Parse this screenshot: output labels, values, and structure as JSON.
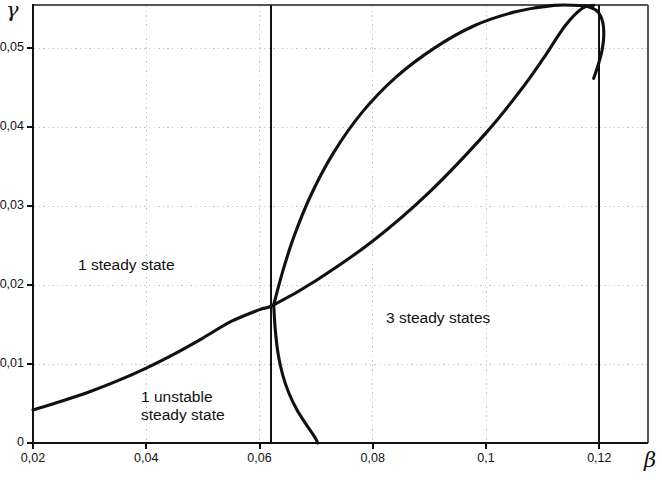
{
  "figure": {
    "type": "chart",
    "background": "#ffffff",
    "ink_color": "#111111",
    "grid_color": "#c8c8c8"
  },
  "axes": {
    "x": {
      "name": "β",
      "ticks": [
        "0,02",
        "0,04",
        "0,06",
        "0,08",
        "0,1",
        "0,12"
      ],
      "tick_values": [
        0.02,
        0.04,
        0.06,
        0.08,
        0.1,
        0.12
      ],
      "range": [
        0.02,
        0.1286
      ]
    },
    "y": {
      "name": "γ",
      "ticks": [
        "0",
        "0,01",
        "0,02",
        "0,03",
        "0,04",
        "0,05"
      ],
      "tick_values": [
        0,
        0.01,
        0.02,
        0.03,
        0.04,
        0.05
      ],
      "range": [
        0,
        0.0555
      ]
    }
  },
  "annotations": {
    "one_steady_state": "1 steady state",
    "three_steady_states": "3 steady states",
    "one_unstable_line1": "1 unstable",
    "one_unstable_line2": "steady state"
  },
  "chart_data": {
    "type": "line",
    "title": "",
    "xlabel": "β",
    "ylabel": "γ",
    "xlim": [
      0.02,
      0.1286
    ],
    "ylim": [
      0.0,
      0.0555
    ],
    "grid": true,
    "grid_style": "dotted",
    "legend": null,
    "xticks": [
      0.02,
      0.04,
      0.06,
      0.08,
      0.1,
      0.12
    ],
    "xticklabels": [
      "0,02",
      "0,04",
      "0,06",
      "0,08",
      "0,1",
      "0,12"
    ],
    "yticks": [
      0,
      0.01,
      0.02,
      0.03,
      0.04,
      0.05
    ],
    "yticklabels": [
      "0",
      "0,01",
      "0,02",
      "0,03",
      "0,04",
      "0,05"
    ],
    "series": [
      {
        "name": "lower fold branch",
        "comment": "rises from left edge through the cusp and on to the apex of the loop",
        "points": [
          [
            0.02,
            0.0042
          ],
          [
            0.025,
            0.0053
          ],
          [
            0.03,
            0.0065
          ],
          [
            0.035,
            0.0079
          ],
          [
            0.04,
            0.0095
          ],
          [
            0.045,
            0.0113
          ],
          [
            0.05,
            0.0133
          ],
          [
            0.055,
            0.0154
          ],
          [
            0.06,
            0.0169
          ],
          [
            0.0625,
            0.0175
          ],
          [
            0.07,
            0.0206
          ],
          [
            0.08,
            0.0256
          ],
          [
            0.09,
            0.0318
          ],
          [
            0.1,
            0.0393
          ],
          [
            0.106,
            0.0446
          ],
          [
            0.11,
            0.0486
          ],
          [
            0.114,
            0.0529
          ],
          [
            0.117,
            0.0551
          ],
          [
            0.119,
            0.05545
          ]
        ]
      },
      {
        "name": "upper fold branch",
        "comment": "steep branch leaving the cusp upward, curving right to the apex",
        "points": [
          [
            0.0625,
            0.0175
          ],
          [
            0.064,
            0.0215
          ],
          [
            0.066,
            0.026
          ],
          [
            0.069,
            0.0313
          ],
          [
            0.073,
            0.0367
          ],
          [
            0.078,
            0.0418
          ],
          [
            0.084,
            0.0463
          ],
          [
            0.091,
            0.0501
          ],
          [
            0.098,
            0.0529
          ],
          [
            0.105,
            0.0546
          ],
          [
            0.112,
            0.05545
          ],
          [
            0.1175,
            0.0554
          ]
        ]
      },
      {
        "name": "loop closing branch",
        "comment": "turns back down at the apex and crosses beta = 0,12",
        "points": [
          [
            0.1175,
            0.0554
          ],
          [
            0.1195,
            0.0548
          ],
          [
            0.1205,
            0.0536
          ],
          [
            0.1208,
            0.0518
          ],
          [
            0.1205,
            0.0498
          ],
          [
            0.1198,
            0.0479
          ],
          [
            0.119,
            0.0462
          ]
        ]
      },
      {
        "name": "descending branch to axis",
        "comment": "falls from the cusp down to gamma = 0 near beta = 0,070",
        "points": [
          [
            0.0625,
            0.0175
          ],
          [
            0.0628,
            0.0142
          ],
          [
            0.0633,
            0.0112
          ],
          [
            0.0641,
            0.0086
          ],
          [
            0.0652,
            0.0063
          ],
          [
            0.0666,
            0.0042
          ],
          [
            0.0682,
            0.0024
          ],
          [
            0.0697,
            0.0008
          ],
          [
            0.0703,
            0.0
          ]
        ]
      }
    ],
    "vertical_lines": [
      {
        "name": "left boundary",
        "x": 0.0621
      },
      {
        "name": "right boundary",
        "x": 0.12
      }
    ],
    "regions": [
      {
        "label": "1 steady state",
        "x": 0.0415,
        "y": 0.0215
      },
      {
        "label": "3 steady states",
        "x": 0.0885,
        "y": 0.015
      },
      {
        "label": "1 unstable steady state",
        "x": 0.0435,
        "y": 0.005
      }
    ]
  }
}
